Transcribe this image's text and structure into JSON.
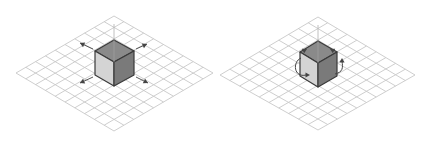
{
  "figure": {
    "panels": [
      {
        "id": "translate",
        "description": "Isometric grid with cube and four directional move arrows",
        "grid": {
          "left": [
            16,
            73
          ],
          "top": [
            114,
            16
          ],
          "right": [
            213,
            73
          ],
          "bottom": [
            114,
            131
          ],
          "divisions": 10
        },
        "cube": {
          "top": [
            114,
            40
          ],
          "tl": [
            95,
            51
          ],
          "tr": [
            134,
            51
          ],
          "center": [
            114,
            62
          ],
          "bl": [
            95,
            75
          ],
          "br": [
            134,
            75
          ],
          "bottom": [
            114,
            86
          ]
        },
        "gizmo": "move-arrows"
      },
      {
        "id": "rotate",
        "description": "Isometric grid with cube and curved rotation arrows",
        "grid": {
          "left": [
            220,
            75
          ],
          "top": [
            318,
            17
          ],
          "right": [
            415,
            75
          ],
          "bottom": [
            318,
            130
          ],
          "divisions": 10
        },
        "cube": {
          "top": [
            318,
            41
          ],
          "tl": [
            300,
            52
          ],
          "tr": [
            337,
            52
          ],
          "center": [
            318,
            63
          ],
          "bl": [
            300,
            76
          ],
          "br": [
            337,
            76
          ],
          "bottom": [
            318,
            87
          ]
        },
        "gizmo": "rotate-arrows"
      }
    ],
    "colors": {
      "grid": "#c8c8c8",
      "cube_top": "#8a8a8a",
      "cube_left": "#d4d4d4",
      "cube_right": "#7a7a7a",
      "cube_edge": "#3a3a3a",
      "arrow": "#444444"
    }
  }
}
